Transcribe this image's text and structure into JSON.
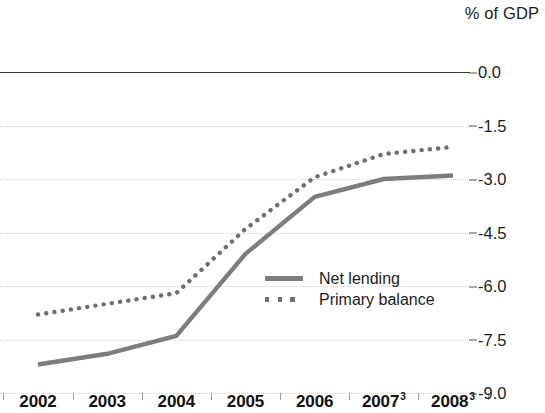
{
  "chart_data": {
    "type": "line",
    "title": "% of GDP",
    "xlabel": "",
    "ylabel": "% of GDP",
    "categories": [
      "2002",
      "2003",
      "2004",
      "2005",
      "2006",
      "2007",
      "2008"
    ],
    "category_footnotes": [
      "",
      "",
      "",
      "",
      "",
      "3",
      "3"
    ],
    "x": [
      2002,
      2003,
      2004,
      2005,
      2006,
      2007,
      2008
    ],
    "series": [
      {
        "name": "Net lending",
        "style": "solid",
        "color": "#7d7d7d",
        "values": [
          -8.2,
          -7.9,
          -7.4,
          -5.1,
          -3.5,
          -3.0,
          -2.9
        ]
      },
      {
        "name": "Primary balance",
        "style": "dotted",
        "color": "#6f6f6f",
        "values": [
          -6.8,
          -6.5,
          -6.2,
          -4.4,
          -2.95,
          -2.3,
          -2.1
        ]
      }
    ],
    "ylim": [
      -9.0,
      0.0
    ],
    "yticks": [
      0.0,
      -1.5,
      -3.0,
      -4.5,
      -6.0,
      -7.5,
      -9.0
    ],
    "ytick_labels": [
      "0.0",
      "-1.5",
      "-3.0",
      "-4.5",
      "-6.0",
      "-7.5",
      "-9.0"
    ],
    "grid": true,
    "grid_color": "#d2d2d2",
    "zero_line_color": "#3a3a3a",
    "legend_position": "center-right-inside"
  },
  "legend": {
    "items": [
      {
        "label": "Net lending"
      },
      {
        "label": "Primary balance"
      }
    ]
  }
}
